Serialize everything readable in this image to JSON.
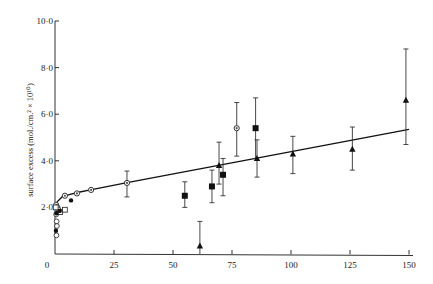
{
  "chart_data": {
    "type": "scatter",
    "title": "",
    "xlabel": "",
    "ylabel": "surface excess (mol./cm.² × 10¹⁰)",
    "xlim": [
      0,
      150
    ],
    "ylim": [
      0,
      10
    ],
    "grid": false,
    "legend": null,
    "x_ticks": [
      "0",
      "25",
      "50",
      "75",
      "100",
      "125",
      "150"
    ],
    "y_ticks": [
      "2·0",
      "4·0",
      "6·0",
      "8·0",
      "10·0"
    ],
    "y_zero_label": "0",
    "series": [
      {
        "name": "half-filled circles",
        "marker": "half-circle",
        "points": [
          {
            "x": 0.5,
            "y": 2.1
          },
          {
            "x": 1.0,
            "y": 2.0
          },
          {
            "x": 4.2,
            "y": 2.5
          },
          {
            "x": 9.3,
            "y": 2.6
          },
          {
            "x": 15.3,
            "y": 2.75
          },
          {
            "x": 30.5,
            "y": 3.05,
            "err_low": 2.45,
            "err_high": 3.56
          },
          {
            "x": 77.0,
            "y": 5.4,
            "err_low": 4.2,
            "err_high": 6.5
          }
        ]
      },
      {
        "name": "open circles",
        "marker": "open-circle",
        "points": [
          {
            "x": 0.5,
            "y": 1.7
          },
          {
            "x": 0.7,
            "y": 1.4
          },
          {
            "x": 0.8,
            "y": 1.2
          },
          {
            "x": 0.6,
            "y": 0.8
          },
          {
            "x": 1.5,
            "y": 1.9
          }
        ]
      },
      {
        "name": "open squares",
        "marker": "open-square",
        "points": [
          {
            "x": 2.2,
            "y": 1.8
          },
          {
            "x": 4.2,
            "y": 1.9
          },
          {
            "x": 0.3,
            "y": 2.0
          }
        ]
      },
      {
        "name": "filled circles",
        "marker": "filled-circle",
        "points": [
          {
            "x": 0.4,
            "y": 1.0
          },
          {
            "x": 0.6,
            "y": 1.75
          },
          {
            "x": 2.0,
            "y": 1.85
          },
          {
            "x": 6.8,
            "y": 2.3
          }
        ]
      },
      {
        "name": "filled squares",
        "marker": "filled-square",
        "points": [
          {
            "x": 55.0,
            "y": 2.5,
            "err_low": 2.0,
            "err_high": 3.1
          },
          {
            "x": 66.5,
            "y": 2.9,
            "err_low": 2.2,
            "err_high": 3.6
          },
          {
            "x": 71.2,
            "y": 3.4,
            "err_low": 2.5,
            "err_high": 4.1
          },
          {
            "x": 85.0,
            "y": 5.4,
            "err_low": 4.1,
            "err_high": 6.7
          }
        ]
      },
      {
        "name": "filled triangles",
        "marker": "filled-triangle",
        "points": [
          {
            "x": 61.4,
            "y": 0.35,
            "err_low": 0.0,
            "err_high": 1.4
          },
          {
            "x": 69.5,
            "y": 3.8,
            "err_low": 3.0,
            "err_high": 4.8
          },
          {
            "x": 85.6,
            "y": 4.1,
            "err_low": 3.3,
            "err_high": 4.9
          },
          {
            "x": 100.8,
            "y": 4.3,
            "err_low": 3.45,
            "err_high": 5.05
          },
          {
            "x": 126.0,
            "y": 4.5,
            "err_low": 3.6,
            "err_high": 5.45
          },
          {
            "x": 148.7,
            "y": 6.6,
            "err_low": 4.7,
            "err_high": 8.8
          }
        ]
      }
    ],
    "fit_curve": {
      "description": "rising curve near origin joining a straight line",
      "points": [
        {
          "x": 0,
          "y": 2.0
        },
        {
          "x": 1,
          "y": 2.25
        },
        {
          "x": 3,
          "y": 2.45
        },
        {
          "x": 6,
          "y": 2.55
        },
        {
          "x": 10,
          "y": 2.65
        },
        {
          "x": 15,
          "y": 2.75
        },
        {
          "x": 30,
          "y": 3.05
        },
        {
          "x": 150,
          "y": 5.35
        }
      ]
    }
  }
}
